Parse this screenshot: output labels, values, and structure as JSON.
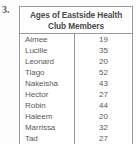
{
  "worksheet": {
    "question_number": "3."
  },
  "table": {
    "title_line_1": "Ages of Eastside Health",
    "title_line_2": "Club Members",
    "title_full": "Ages of Eastside Health Club Members",
    "border_color": "#9a9a9a",
    "text_color": "#5a5a5a",
    "rows": [
      {
        "name": "Aimee",
        "age": "19"
      },
      {
        "name": "Lucille",
        "age": "35"
      },
      {
        "name": "Leonard",
        "age": "20"
      },
      {
        "name": "Tiago",
        "age": "52"
      },
      {
        "name": "Nakeisha",
        "age": "43"
      },
      {
        "name": "Hector",
        "age": "27"
      },
      {
        "name": "Robin",
        "age": "44"
      },
      {
        "name": "Haleem",
        "age": "20"
      },
      {
        "name": "Marrissa",
        "age": "32"
      },
      {
        "name": "Tad",
        "age": "27"
      }
    ]
  },
  "chart_data": {
    "type": "table",
    "title": "Ages of Eastside Health Club Members",
    "columns": [
      "Name",
      "Age"
    ],
    "categories": [
      "Aimee",
      "Lucille",
      "Leonard",
      "Tiago",
      "Nakeisha",
      "Hector",
      "Robin",
      "Haleem",
      "Marrissa",
      "Tad"
    ],
    "values": [
      19,
      35,
      20,
      52,
      43,
      27,
      44,
      20,
      32,
      27
    ],
    "xlabel": "",
    "ylabel": "Age"
  }
}
